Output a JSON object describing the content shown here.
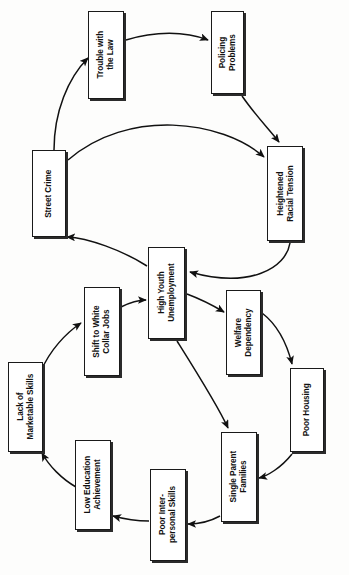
{
  "diagram": {
    "type": "causal-loop-diagram",
    "orientation": "rotated-90-counterclockwise",
    "background_color": "#fdfdfc",
    "box_fill_color": "#ffffff",
    "box_border_color": "#1a1a1a",
    "shadow_color": "#2b2b2b",
    "arrow_color": "#111111",
    "nodes": [
      {
        "id": "trouble-with-the-law",
        "label": "Trouble with\nthe Law",
        "x": 88,
        "y": 11,
        "w": 36,
        "h": 88
      },
      {
        "id": "policing-problems",
        "label": "Policing\nProblems",
        "x": 211,
        "y": 11,
        "w": 33,
        "h": 83
      },
      {
        "id": "street-crime",
        "label": "Street Crime",
        "x": 32,
        "y": 150,
        "w": 34,
        "h": 87
      },
      {
        "id": "heightened-racial-tension",
        "label": "Heightened\nRacial Tension",
        "x": 267,
        "y": 146,
        "w": 36,
        "h": 95
      },
      {
        "id": "high-youth-unemployment",
        "label": "High Youth\nUnemployment",
        "x": 148,
        "y": 247,
        "w": 37,
        "h": 92
      },
      {
        "id": "welfare-dependency",
        "label": "Welfare\nDependency",
        "x": 226,
        "y": 290,
        "w": 35,
        "h": 85
      },
      {
        "id": "shift-to-white-collar-jobs",
        "label": "Shift to White\nCollar Jobs",
        "x": 84,
        "y": 287,
        "w": 36,
        "h": 89
      },
      {
        "id": "poor-housing",
        "label": "Poor Housing",
        "x": 290,
        "y": 368,
        "w": 34,
        "h": 84
      },
      {
        "id": "lack-of-marketable-skills",
        "label": "Lack of\nMarketable Skills",
        "x": 8,
        "y": 362,
        "w": 35,
        "h": 90
      },
      {
        "id": "single-parent-families",
        "label": "Single Parent\nFamilies",
        "x": 221,
        "y": 432,
        "w": 36,
        "h": 90
      },
      {
        "id": "low-education-achievement",
        "label": "Low Education\nAchievement",
        "x": 75,
        "y": 440,
        "w": 36,
        "h": 90
      },
      {
        "id": "poor-inter-personal-skills",
        "label": "Poor Inter-\npersonal Skills",
        "x": 150,
        "y": 469,
        "w": 36,
        "h": 92
      }
    ],
    "edges": [
      {
        "from": "trouble-with-the-law",
        "to": "policing-problems"
      },
      {
        "from": "policing-problems",
        "to": "heightened-racial-tension"
      },
      {
        "from": "street-crime",
        "to": "trouble-with-the-law"
      },
      {
        "from": "street-crime",
        "to": "heightened-racial-tension"
      },
      {
        "from": "heightened-racial-tension",
        "to": "high-youth-unemployment"
      },
      {
        "from": "high-youth-unemployment",
        "to": "street-crime"
      },
      {
        "from": "shift-to-white-collar-jobs",
        "to": "high-youth-unemployment"
      },
      {
        "from": "high-youth-unemployment",
        "to": "welfare-dependency"
      },
      {
        "from": "welfare-dependency",
        "to": "poor-housing"
      },
      {
        "from": "high-youth-unemployment",
        "to": "single-parent-families"
      },
      {
        "from": "poor-housing",
        "to": "single-parent-families"
      },
      {
        "from": "single-parent-families",
        "to": "poor-inter-personal-skills"
      },
      {
        "from": "poor-inter-personal-skills",
        "to": "low-education-achievement"
      },
      {
        "from": "low-education-achievement",
        "to": "lack-of-marketable-skills"
      },
      {
        "from": "lack-of-marketable-skills",
        "to": "shift-to-white-collar-jobs"
      }
    ]
  }
}
